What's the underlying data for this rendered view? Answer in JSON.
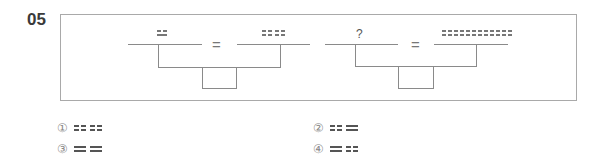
{
  "question": {
    "number": "05",
    "group_left": {
      "left_numerator": [
        [
          "broken",
          "solid"
        ]
      ],
      "right_numerator": [
        [
          "broken",
          "broken"
        ],
        [
          "broken",
          "broken"
        ]
      ],
      "equals": "="
    },
    "group_right": {
      "left_numerator_label": "?",
      "right_numerator": [
        [
          "broken",
          "broken"
        ],
        [
          "broken",
          "broken"
        ],
        [
          "broken",
          "broken"
        ],
        [
          "broken",
          "broken"
        ],
        [
          "broken",
          "broken"
        ],
        [
          "broken",
          "broken"
        ]
      ],
      "equals": "="
    }
  },
  "options": [
    {
      "label": "①",
      "glyphs": [
        [
          "broken",
          "broken"
        ],
        [
          "broken",
          "broken"
        ]
      ]
    },
    {
      "label": "②",
      "glyphs": [
        [
          "broken",
          "broken"
        ],
        [
          "solid",
          "solid"
        ]
      ]
    },
    {
      "label": "③",
      "glyphs": [
        [
          "solid",
          "solid"
        ],
        [
          "solid",
          "solid"
        ]
      ]
    },
    {
      "label": "④",
      "glyphs": [
        [
          "solid",
          "solid"
        ],
        [
          "broken",
          "broken"
        ]
      ]
    }
  ]
}
